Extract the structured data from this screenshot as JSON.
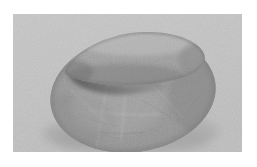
{
  "image": {
    "subject": "two grey stones stacked",
    "caption_visible": "",
    "frame": {
      "outer_background": "#ffffff",
      "border_left": 13,
      "border_top": 14,
      "photo_width": 229,
      "photo_height": 138
    },
    "palette": {
      "page_white": "#ffffff",
      "photo_background": "#c9c9c9",
      "photo_background_light": "#d2d2d2",
      "photo_background_dark": "#bfbfbf",
      "stone_base_mid": "#9c9c9c",
      "stone_base_light": "#b6b6b6",
      "stone_base_dark": "#7a7a7a",
      "stone_top_light": "#c0c0c0",
      "stone_top_mid": "#a6a6a6",
      "crevice_shadow": "#4f4f4f",
      "cast_shadow": "#a8a8a8",
      "edge_outline": "#6e6e6e"
    },
    "objects": [
      {
        "name": "lower-stone",
        "description": "large rounded oval pebble, flat resting stone",
        "center_x": 120,
        "center_y": 80,
        "radius_x": 83,
        "radius_y": 58,
        "rotation_deg": -8,
        "surface": "granular speckled granite with faint scratch lines"
      },
      {
        "name": "upper-stone",
        "description": "elongated flattened pebble resting on top, tapering to the left",
        "center_x": 118,
        "center_y": 42,
        "radius_x": 67,
        "radius_y": 25,
        "rotation_deg": -9,
        "surface": "granular speckled granite, lighter top highlight"
      },
      {
        "name": "cast-shadow",
        "description": "soft shadow beneath the lower stone toward bottom-left and bottom-right",
        "center_x": 122,
        "center_y": 128,
        "radius_x": 80,
        "radius_y": 16
      }
    ],
    "scratch_lines": [
      {
        "x1": 96,
        "y1": 62,
        "x2": 84,
        "y2": 132
      },
      {
        "x1": 112,
        "y1": 64,
        "x2": 108,
        "y2": 126
      },
      {
        "x1": 60,
        "y1": 78,
        "x2": 96,
        "y2": 112
      },
      {
        "x1": 140,
        "y1": 74,
        "x2": 168,
        "y2": 104
      }
    ]
  }
}
